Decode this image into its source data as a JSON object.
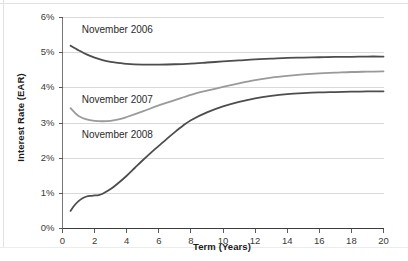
{
  "chart_data": {
    "type": "line",
    "title": "",
    "xlabel": "Term (Years)",
    "ylabel": "Interest Rate (EAR)",
    "xlim": [
      0,
      20
    ],
    "ylim": [
      0,
      6
    ],
    "xticks": [
      0,
      2,
      4,
      6,
      8,
      10,
      12,
      14,
      16,
      18,
      20
    ],
    "xtick_labels": [
      "0",
      "2",
      "4",
      "6",
      "8",
      "10",
      "12",
      "14",
      "16",
      "18",
      "20"
    ],
    "yticks": [
      0,
      1,
      2,
      3,
      4,
      5,
      6
    ],
    "ytick_labels": [
      "0%",
      "1%",
      "2%",
      "3%",
      "4%",
      "5%",
      "6%"
    ],
    "grid": true,
    "grid_axis": "y",
    "legend": "inline-annotations",
    "series": [
      {
        "name": "November 2006",
        "color": "#4d4d4d",
        "label_x": 1.2,
        "label_y": 5.62,
        "x": [
          0.5,
          0.75,
          1,
          1.5,
          2,
          2.5,
          3,
          3.5,
          4,
          5,
          6,
          7,
          8,
          9,
          10,
          11,
          12,
          13,
          14,
          15,
          16,
          17,
          18,
          19,
          20
        ],
        "y": [
          5.2,
          5.13,
          5.07,
          4.95,
          4.86,
          4.79,
          4.74,
          4.71,
          4.68,
          4.66,
          4.66,
          4.67,
          4.69,
          4.72,
          4.75,
          4.78,
          4.81,
          4.83,
          4.85,
          4.86,
          4.87,
          4.88,
          4.88,
          4.89,
          4.89
        ]
      },
      {
        "name": "November 2007",
        "color": "#9a9a9a",
        "label_x": 1.2,
        "label_y": 3.62,
        "x": [
          0.5,
          0.75,
          1,
          1.5,
          2,
          2.5,
          3,
          3.5,
          4,
          5,
          6,
          7,
          8,
          9,
          10,
          11,
          12,
          13,
          14,
          15,
          16,
          17,
          18,
          19,
          20
        ],
        "y": [
          3.42,
          3.3,
          3.2,
          3.1,
          3.06,
          3.05,
          3.06,
          3.1,
          3.17,
          3.33,
          3.5,
          3.65,
          3.8,
          3.92,
          4.03,
          4.13,
          4.22,
          4.29,
          4.34,
          4.38,
          4.41,
          4.43,
          4.45,
          4.46,
          4.47
        ]
      },
      {
        "name": "November 2008",
        "color": "#4d4d4d",
        "label_x": 1.2,
        "label_y": 2.62,
        "x": [
          0.5,
          0.75,
          1,
          1.25,
          1.5,
          1.75,
          2,
          2.25,
          2.5,
          3,
          3.5,
          4,
          4.5,
          5,
          5.5,
          6,
          6.5,
          7,
          7.5,
          8,
          9,
          10,
          11,
          12,
          13,
          14,
          15,
          16,
          17,
          18,
          19,
          20
        ],
        "y": [
          0.5,
          0.66,
          0.78,
          0.86,
          0.91,
          0.93,
          0.94,
          0.95,
          0.99,
          1.12,
          1.3,
          1.5,
          1.72,
          1.94,
          2.15,
          2.35,
          2.55,
          2.74,
          2.92,
          3.08,
          3.3,
          3.47,
          3.6,
          3.7,
          3.77,
          3.82,
          3.85,
          3.87,
          3.88,
          3.89,
          3.9,
          3.9
        ]
      }
    ]
  },
  "axes": {
    "y_title": "Interest Rate (EAR)",
    "x_title": "Term (Years)"
  },
  "colors": {
    "series_dark": "#4d4d4d",
    "series_light": "#9a9a9a",
    "grid": "#d9d9d9",
    "axis": "#777777",
    "text": "#2b2b2b",
    "background": "#ffffff"
  }
}
